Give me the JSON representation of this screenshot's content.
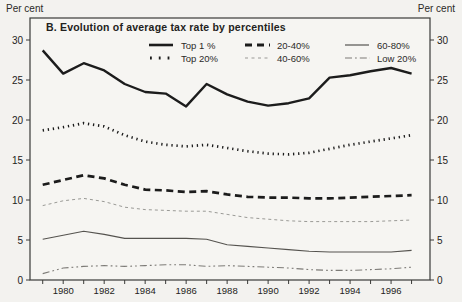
{
  "axis_unit_left": "Per cent",
  "axis_unit_right": "Per cent",
  "chart_data": {
    "type": "line",
    "title": "B.  Evolution of average tax rate by percentiles",
    "ylabel_left": "Per cent",
    "ylabel_right": "Per cent",
    "grid": false,
    "legend_position": "top-inside",
    "x": [
      1979,
      1980,
      1981,
      1982,
      1983,
      1984,
      1985,
      1986,
      1987,
      1988,
      1989,
      1990,
      1991,
      1992,
      1993,
      1994,
      1995,
      1996,
      1997
    ],
    "x_tick_labels": [
      "1980",
      "1982",
      "1984",
      "1986",
      "1988",
      "1990",
      "1992",
      "1994",
      "1996"
    ],
    "x_tick_years": [
      1980,
      1982,
      1984,
      1986,
      1988,
      1990,
      1992,
      1994,
      1996
    ],
    "y_ticks": [
      0,
      5,
      10,
      15,
      20,
      25,
      30
    ],
    "ylim": [
      0,
      32.75
    ],
    "xlim": [
      1978.38,
      1997.9
    ],
    "colors": {
      "ink": "#232220",
      "mid_gray": "#55534f",
      "light_gray": "#9a9a96",
      "dashdot_gray": "#7d7b77",
      "frame": "#3a3a38",
      "background": "#f3f2ef"
    },
    "series": [
      {
        "name": "Top 1 %",
        "style": "solid-thick",
        "color": "#1c1c1c",
        "values": [
          28.7,
          25.8,
          27.1,
          26.2,
          24.5,
          23.5,
          23.3,
          21.7,
          24.5,
          23.2,
          22.3,
          21.8,
          22.1,
          22.7,
          25.3,
          25.6,
          26.1,
          26.5,
          25.8
        ]
      },
      {
        "name": "Top 20%",
        "style": "dotted-bold",
        "color": "#1c1c1c",
        "values": [
          18.7,
          19.1,
          19.6,
          19.2,
          18.1,
          17.3,
          16.9,
          16.7,
          16.9,
          16.5,
          16.1,
          15.8,
          15.7,
          15.9,
          16.4,
          16.9,
          17.3,
          17.7,
          18.1
        ]
      },
      {
        "name": "20-40%",
        "style": "dashed-thick",
        "color": "#1c1c1c",
        "values": [
          11.9,
          12.5,
          13.1,
          12.7,
          11.9,
          11.3,
          11.2,
          11.0,
          11.1,
          10.7,
          10.4,
          10.3,
          10.3,
          10.2,
          10.2,
          10.3,
          10.4,
          10.5,
          10.6
        ]
      },
      {
        "name": "40-60%",
        "style": "dashed-thin",
        "color": "#9a9a96",
        "values": [
          9.3,
          9.9,
          10.2,
          9.8,
          9.1,
          8.8,
          8.7,
          8.6,
          8.6,
          8.2,
          7.8,
          7.6,
          7.4,
          7.3,
          7.3,
          7.3,
          7.3,
          7.4,
          7.5
        ]
      },
      {
        "name": "60-80%",
        "style": "solid-thin",
        "color": "#55534f",
        "values": [
          5.1,
          5.6,
          6.1,
          5.7,
          5.2,
          5.2,
          5.2,
          5.2,
          5.1,
          4.4,
          4.2,
          4.0,
          3.8,
          3.6,
          3.5,
          3.5,
          3.5,
          3.5,
          3.7
        ]
      },
      {
        "name": "Low 20%",
        "style": "dashdot-thin",
        "color": "#7d7b77",
        "values": [
          0.8,
          1.5,
          1.7,
          1.8,
          1.7,
          1.8,
          1.9,
          1.9,
          1.7,
          1.8,
          1.7,
          1.6,
          1.5,
          1.3,
          1.2,
          1.2,
          1.3,
          1.4,
          1.6
        ]
      }
    ]
  }
}
